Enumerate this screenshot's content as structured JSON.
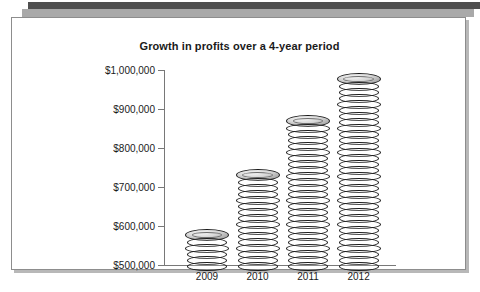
{
  "chart_data": {
    "type": "bar",
    "title": "Growth in profits over a 4-year period",
    "xlabel": "",
    "ylabel": "",
    "categories": [
      "2009",
      "2010",
      "2011",
      "2012"
    ],
    "values": [
      590000,
      740000,
      890000,
      985000
    ],
    "ylim": [
      500000,
      1000000
    ],
    "ytick_values": [
      500000,
      600000,
      700000,
      800000,
      900000,
      1000000
    ],
    "ytick_labels": [
      "$500,000",
      "$600,000",
      "$700,000",
      "$800,000",
      "$900,000",
      "$1,000,000"
    ],
    "grid": false,
    "legend": null,
    "marker_style": "coin-stack",
    "colors": {
      "coin_light": "#cfcfcf",
      "coin_mid": "#9a9a9a",
      "coin_dark": "#4a4a4a",
      "axis": "#787878",
      "text": "#1a1a1a"
    }
  },
  "decor": {
    "top_bar_dark_color": "#4f4f4f",
    "top_bar_light_color": "#a9a9a9",
    "panel_border_color": "#8d8d8d",
    "panel_background": "#ffffff"
  }
}
